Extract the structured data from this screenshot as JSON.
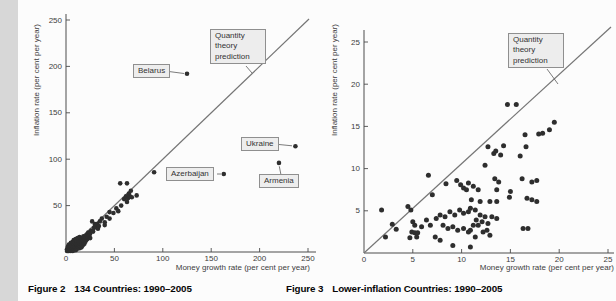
{
  "page": {
    "left_caption": {
      "prefix": "Figure 2",
      "text": "134 Countries: 1990–2005"
    },
    "right_caption": {
      "prefix": "Figure 3",
      "text": "Lower-inflation Countries: 1990–2005"
    }
  },
  "chart_data": [
    {
      "id": "figure2",
      "type": "scatter",
      "title": "Figure 2 134 Countries: 1990–2005",
      "xlabel": "Money growth rate (per cent per year)",
      "ylabel": "Inflation rate (per cent per year)",
      "xlim": [
        0,
        250
      ],
      "ylim": [
        0,
        250
      ],
      "x_ticks": [
        0,
        50,
        100,
        150,
        200,
        250
      ],
      "y_ticks": [
        50,
        100,
        150,
        200,
        250
      ],
      "grid": false,
      "reference_line": {
        "label": "Quantity theory prediction",
        "from": [
          0,
          0
        ],
        "to": [
          250,
          250
        ]
      },
      "annotations": [
        {
          "label": "Belarus",
          "point": [
            125,
            192
          ]
        },
        {
          "label": "Ukraine",
          "point": [
            237,
            114
          ]
        },
        {
          "label": "Armenia",
          "point": [
            220,
            96
          ]
        },
        {
          "label": "Azerbaijan",
          "point": [
            163,
            84
          ]
        }
      ],
      "points": [
        [
          1,
          1
        ],
        [
          1,
          3
        ],
        [
          2,
          1
        ],
        [
          2,
          2
        ],
        [
          2,
          4
        ],
        [
          2,
          6
        ],
        [
          3,
          1
        ],
        [
          3,
          3
        ],
        [
          3,
          5
        ],
        [
          3,
          8
        ],
        [
          4,
          2
        ],
        [
          4,
          4
        ],
        [
          4,
          6
        ],
        [
          5,
          1
        ],
        [
          5,
          3
        ],
        [
          5,
          5
        ],
        [
          5,
          8
        ],
        [
          5,
          10
        ],
        [
          6,
          2
        ],
        [
          6,
          4
        ],
        [
          6,
          6
        ],
        [
          6,
          9
        ],
        [
          7,
          1
        ],
        [
          7,
          3
        ],
        [
          7,
          5
        ],
        [
          7,
          7
        ],
        [
          7,
          11
        ],
        [
          8,
          2
        ],
        [
          8,
          4
        ],
        [
          8,
          6
        ],
        [
          8,
          9
        ],
        [
          8,
          13
        ],
        [
          9,
          3
        ],
        [
          9,
          5
        ],
        [
          9,
          7
        ],
        [
          9,
          11
        ],
        [
          10,
          2
        ],
        [
          10,
          4
        ],
        [
          10,
          6
        ],
        [
          10,
          9
        ],
        [
          10,
          14
        ],
        [
          11,
          3
        ],
        [
          11,
          5
        ],
        [
          11,
          8
        ],
        [
          11,
          12
        ],
        [
          12,
          4
        ],
        [
          12,
          6
        ],
        [
          12,
          10
        ],
        [
          12,
          15
        ],
        [
          13,
          5
        ],
        [
          13,
          8
        ],
        [
          13,
          12
        ],
        [
          14,
          4
        ],
        [
          14,
          7
        ],
        [
          14,
          10
        ],
        [
          14,
          16
        ],
        [
          15,
          6
        ],
        [
          15,
          9
        ],
        [
          15,
          13
        ],
        [
          16,
          5
        ],
        [
          16,
          8
        ],
        [
          16,
          11
        ],
        [
          16,
          15
        ],
        [
          17,
          7
        ],
        [
          17,
          10
        ],
        [
          17,
          14
        ],
        [
          18,
          8
        ],
        [
          18,
          12
        ],
        [
          18,
          17
        ],
        [
          19,
          9
        ],
        [
          19,
          14
        ],
        [
          20,
          11
        ],
        [
          20,
          16
        ],
        [
          21,
          13
        ],
        [
          21,
          18
        ],
        [
          22,
          14
        ],
        [
          22,
          19
        ],
        [
          23,
          16
        ],
        [
          23,
          21
        ],
        [
          24,
          18
        ],
        [
          25,
          15
        ],
        [
          25,
          20
        ],
        [
          26,
          23
        ],
        [
          27,
          33
        ],
        [
          28,
          22
        ],
        [
          29,
          26
        ],
        [
          30,
          27
        ],
        [
          30,
          30
        ],
        [
          32,
          30
        ],
        [
          33,
          25
        ],
        [
          34,
          28
        ],
        [
          35,
          33
        ],
        [
          37,
          36
        ],
        [
          40,
          29
        ],
        [
          40,
          32
        ],
        [
          42,
          38
        ],
        [
          45,
          36
        ],
        [
          45,
          43
        ],
        [
          49,
          42
        ],
        [
          52,
          47
        ],
        [
          54,
          44
        ],
        [
          57,
          50
        ],
        [
          60,
          57
        ],
        [
          62,
          60
        ],
        [
          63,
          54
        ],
        [
          64,
          58
        ],
        [
          65,
          63
        ],
        [
          66,
          60
        ],
        [
          67,
          66
        ],
        [
          68,
          59
        ],
        [
          73,
          61
        ],
        [
          56,
          74
        ],
        [
          63,
          74
        ],
        [
          91,
          86
        ],
        [
          125,
          192
        ],
        [
          163,
          84
        ],
        [
          220,
          96
        ],
        [
          237,
          114
        ]
      ]
    },
    {
      "id": "figure3",
      "type": "scatter",
      "title": "Figure 3 Lower-inflation Countries: 1990–2005",
      "xlabel": "Money growth rate (per cent per year)",
      "ylabel": "Inflation rate (per cent per year)",
      "xlim": [
        0,
        25
      ],
      "ylim": [
        0,
        25
      ],
      "x_ticks": [
        0,
        5,
        10,
        15,
        20,
        25
      ],
      "y_ticks": [
        5,
        10,
        15,
        20,
        25
      ],
      "grid": false,
      "reference_line": {
        "label": "Quantity theory prediction",
        "from": [
          0,
          0
        ],
        "to": [
          25,
          25
        ]
      },
      "annotations": [],
      "points": [
        [
          1.8,
          5.1
        ],
        [
          2.2,
          1.9
        ],
        [
          2.9,
          3.4
        ],
        [
          3.3,
          2.8
        ],
        [
          4.5,
          5.5
        ],
        [
          4.8,
          5.1
        ],
        [
          4.7,
          1.8
        ],
        [
          4.9,
          2.5
        ],
        [
          5.0,
          3.7
        ],
        [
          5.2,
          3.3
        ],
        [
          5.2,
          2.4
        ],
        [
          5.4,
          1.9
        ],
        [
          5.5,
          2.4
        ],
        [
          5.9,
          3.1
        ],
        [
          6.4,
          3.9
        ],
        [
          6.6,
          9.2
        ],
        [
          6.8,
          3.3
        ],
        [
          7.0,
          6.9
        ],
        [
          7.3,
          1.9
        ],
        [
          7.4,
          4.1
        ],
        [
          7.8,
          4.5
        ],
        [
          7.8,
          1.5
        ],
        [
          8.1,
          3.3
        ],
        [
          8.3,
          4.3
        ],
        [
          8.4,
          8.2
        ],
        [
          8.6,
          2.9
        ],
        [
          8.8,
          4.9
        ],
        [
          9.1,
          3.1
        ],
        [
          9.1,
          0.9
        ],
        [
          9.3,
          4.5
        ],
        [
          9.5,
          8.6
        ],
        [
          9.6,
          2.7
        ],
        [
          9.8,
          5.1
        ],
        [
          9.9,
          8.1
        ],
        [
          10.2,
          7.7
        ],
        [
          10.2,
          4.7
        ],
        [
          10.2,
          2.9
        ],
        [
          10.5,
          7.5
        ],
        [
          10.7,
          8.3
        ],
        [
          10.7,
          4.9
        ],
        [
          10.7,
          2.5
        ],
        [
          10.9,
          5.3
        ],
        [
          10.9,
          2.7
        ],
        [
          10.9,
          0.7
        ],
        [
          11.0,
          6.3
        ],
        [
          11.2,
          7.9
        ],
        [
          11.2,
          3.3
        ],
        [
          11.4,
          5.1
        ],
        [
          11.4,
          1.9
        ],
        [
          11.5,
          3.9
        ],
        [
          11.7,
          7.5
        ],
        [
          11.7,
          3.3
        ],
        [
          11.9,
          6.1
        ],
        [
          11.9,
          4.5
        ],
        [
          12.1,
          3.7
        ],
        [
          12.2,
          2.5
        ],
        [
          12.4,
          10.4
        ],
        [
          12.4,
          4.3
        ],
        [
          12.6,
          2.7
        ],
        [
          12.7,
          12.6
        ],
        [
          12.7,
          3.5
        ],
        [
          12.9,
          6.1
        ],
        [
          12.9,
          2.1
        ],
        [
          13.1,
          4.3
        ],
        [
          13.3,
          11.8
        ],
        [
          13.5,
          12.1
        ],
        [
          13.4,
          8.8
        ],
        [
          13.6,
          7.5
        ],
        [
          13.6,
          6.1
        ],
        [
          13.6,
          4.1
        ],
        [
          13.8,
          8.4
        ],
        [
          14.0,
          11.6
        ],
        [
          14.3,
          12.7
        ],
        [
          14.7,
          17.6
        ],
        [
          14.9,
          6.6
        ],
        [
          15.0,
          7.3
        ],
        [
          15.6,
          17.6
        ],
        [
          16.0,
          11.5
        ],
        [
          16.2,
          8.8
        ],
        [
          16.3,
          2.9
        ],
        [
          16.5,
          14.0
        ],
        [
          16.6,
          12.6
        ],
        [
          16.7,
          6.5
        ],
        [
          16.8,
          2.9
        ],
        [
          17.2,
          8.4
        ],
        [
          17.2,
          6.3
        ],
        [
          17.7,
          8.6
        ],
        [
          17.7,
          6.1
        ],
        [
          17.9,
          14.1
        ],
        [
          18.3,
          14.2
        ],
        [
          19.0,
          14.6
        ],
        [
          19.5,
          15.5
        ]
      ]
    }
  ]
}
